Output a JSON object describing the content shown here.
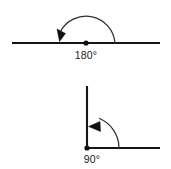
{
  "figure": {
    "background_color": "#ffffff",
    "line_color": "#151515",
    "arc_color": "#303030",
    "text_color": "#1a1a1a"
  },
  "diagrams": [
    {
      "name": "straight-angle",
      "label": "180°",
      "degrees": 180,
      "label_x": 86,
      "label_y": 59,
      "vertex": {
        "x": 86,
        "y": 43
      },
      "rays": [
        {
          "name": "ray-left",
          "x1": 12,
          "y1": 43,
          "x2": 86,
          "y2": 43
        },
        {
          "name": "ray-right",
          "x1": 86,
          "y1": 43,
          "x2": 160,
          "y2": 43
        }
      ],
      "arc": {
        "radius": 29,
        "path": "M 115 43 A 29 29 0 0 0 60.5 31.5",
        "direction": "counterclockwise"
      },
      "arrow": {
        "points": "57,29 65,33 59,41",
        "direction": "down-left"
      }
    },
    {
      "name": "right-angle",
      "label": "90°",
      "degrees": 90,
      "label_x": 92,
      "label_y": 163,
      "vertex": {
        "x": 87,
        "y": 148
      },
      "rays": [
        {
          "name": "ray-vertical",
          "x1": 87,
          "y1": 86,
          "x2": 87,
          "y2": 148
        },
        {
          "name": "ray-horizontal",
          "x1": 87,
          "y1": 148,
          "x2": 160,
          "y2": 148
        }
      ],
      "arc": {
        "radius": 32,
        "path": "M 119 148 A 32 32 0 0 0 99.5 118.5",
        "direction": "counterclockwise"
      },
      "arrow": {
        "points": "89,126 99,122 100,131",
        "direction": "up-left"
      }
    }
  ]
}
